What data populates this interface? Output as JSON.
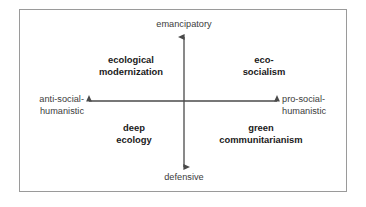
{
  "figure": {
    "kind": "two-axis-quadrant-diagram",
    "frame": {
      "border_color": "#9a9a9a",
      "background": "#ffffff"
    },
    "axis_color": "#4a4a4a",
    "text_color": "#3b3b3b",
    "quadrant_text_color": "#1a1a1a"
  },
  "axes": {
    "vertical": {
      "top_label_line1": "emancipatory",
      "bottom_label_line1": "defensive"
    },
    "horizontal": {
      "left_label_line1": "anti-social-",
      "left_label_line2": "humanistic",
      "right_label_line1": "pro-social-",
      "right_label_line2": "humanistic"
    }
  },
  "quadrants": {
    "top_left": {
      "line1": "ecological",
      "line2": "modernization"
    },
    "top_right": {
      "line1": "eco-",
      "line2": "socialism"
    },
    "bottom_left": {
      "line1": "deep",
      "line2": "ecology"
    },
    "bottom_right": {
      "line1": "green",
      "line2": "communitarianism"
    }
  }
}
